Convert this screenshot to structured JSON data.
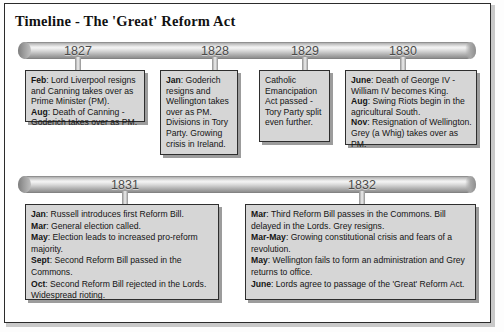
{
  "title": "Timeline - The 'Great' Reform Act",
  "timelines": [
    {
      "name": "upper-timeline",
      "years": [
        "1827",
        "1828",
        "1829",
        "1830"
      ]
    },
    {
      "name": "lower-timeline",
      "years": [
        "1831",
        "1832"
      ]
    }
  ],
  "events": {
    "e1827": [
      {
        "month": "Feb",
        "text": ": Lord Liverpool resigns and Canning takes over as Prime Minister (PM)."
      },
      {
        "month": "Aug",
        "text": ": Death of Canning - Goderich takes over as PM."
      }
    ],
    "e1828": [
      {
        "month": "Jan",
        "text": ": Goderich resigns and Wellington takes over as PM. Divisions in Tory Party. Growing crisis in Ireland."
      }
    ],
    "e1829": [
      {
        "month": "",
        "text": "Catholic Emancipation Act passed - Tory Party split even further."
      }
    ],
    "e1830": [
      {
        "month": "June",
        "text": ": Death of George IV - William IV becomes King."
      },
      {
        "month": "Aug",
        "text": ": Swing Riots begin in the agricultural South."
      },
      {
        "month": "Nov",
        "text": ": Resignation of Wellington. Grey (a Whig) takes over as PM."
      }
    ],
    "e1831": [
      {
        "month": "Jan",
        "text": ": Russell introduces first Reform Bill."
      },
      {
        "month": "Mar",
        "text": ": General election called."
      },
      {
        "month": "May",
        "text": ": Election leads to increased pro-reform majority."
      },
      {
        "month": "Sept",
        "text": ": Second Reform Bill passed in the Commons."
      },
      {
        "month": "Oct",
        "text": ": Second Reform Bill rejected in the Lords. Widespread rioting."
      }
    ],
    "e1832": [
      {
        "month": "Mar",
        "text": ": Third Reform Bill passes in the Commons. Bill delayed in the Lords. Grey resigns."
      },
      {
        "month": "Mar-May",
        "text": ": Growing constitutional crisis and fears of a revolution."
      },
      {
        "month": "May",
        "text": ": Wellington fails to form an administration and Grey returns to office."
      },
      {
        "month": "June",
        "text": ": Lords agree to passage of the 'Great' Reform Act."
      }
    ]
  },
  "colors": {
    "box_fill": "#d6d6d6",
    "box_border": "#2e2e2e",
    "frame_border": "#2b2b2b",
    "year_text": "#4a4a4a"
  }
}
